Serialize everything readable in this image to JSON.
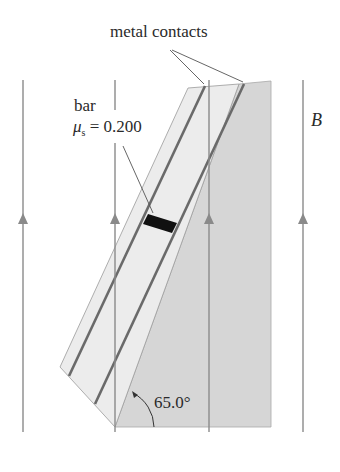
{
  "figure": {
    "labels": {
      "contacts": "metal contacts",
      "bar": "bar",
      "mu_symbol": "μ",
      "mu_subscript": "s",
      "mu_value": "= 0.200",
      "field": "B",
      "angle": "65.0°"
    },
    "colors": {
      "field_line": "#8a8a8a",
      "wedge": "#d4d4d4",
      "incline": "#e8e8e8",
      "rail": "#6e6e6e",
      "bar": "#111111",
      "text": "#2a2a2a"
    },
    "field_lines_x": [
      23,
      115,
      209,
      303
    ],
    "angle_deg": 65.0,
    "mu_s": 0.2
  }
}
